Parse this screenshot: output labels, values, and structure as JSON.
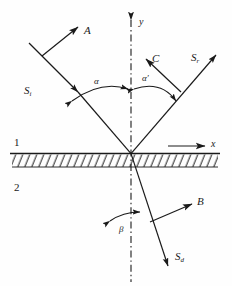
{
  "figure": {
    "stroke_color": "#1a1a1a",
    "background_color": "#fefefe",
    "axes": {
      "y_label": "y",
      "x_label": "x",
      "normal_style": "dash-dot"
    },
    "regions": [
      {
        "name": "medium-upper",
        "label": "1"
      },
      {
        "name": "medium-lower",
        "label": "2"
      }
    ],
    "rays": [
      {
        "name": "incident-ray",
        "label": "S",
        "sub": "i"
      },
      {
        "name": "reflected-ray",
        "label": "S",
        "sub": "r"
      },
      {
        "name": "refracted-ray",
        "label": "S",
        "sub": "d"
      }
    ],
    "vectors": [
      {
        "name": "vector-a",
        "label": "A"
      },
      {
        "name": "vector-c",
        "label": "C"
      },
      {
        "name": "vector-b",
        "label": "B"
      }
    ],
    "angles": [
      {
        "name": "angle-incidence",
        "label": "α"
      },
      {
        "name": "angle-reflection",
        "label": "α",
        "prime": "′"
      },
      {
        "name": "angle-refraction",
        "label": "β"
      }
    ]
  }
}
